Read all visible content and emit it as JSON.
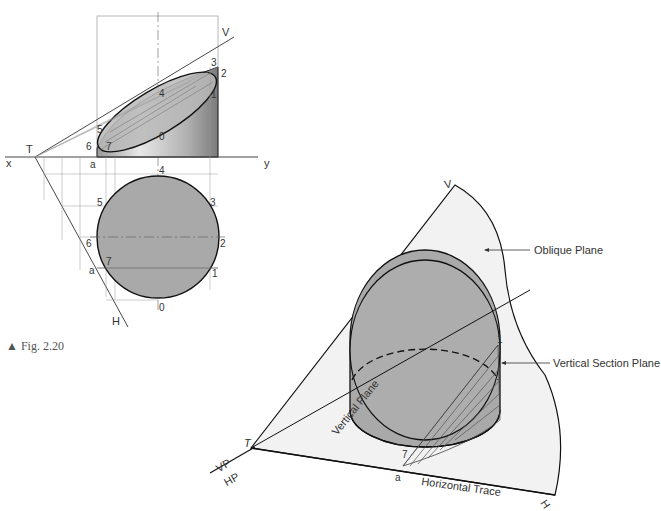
{
  "figure": {
    "caption": "▲ Fig. 2.20"
  },
  "orthographic": {
    "ground_line_left": "x",
    "ground_line_right": "y",
    "trace_point": "T",
    "vertical_trace": "V",
    "horizontal_trace": "H",
    "front_view_points": [
      "0",
      "1",
      "2",
      "3",
      "4",
      "5",
      "6",
      "7",
      "a"
    ],
    "top_view_points": [
      "0",
      "1",
      "2",
      "3",
      "4",
      "5",
      "6",
      "7",
      "a"
    ]
  },
  "pictorial": {
    "apex_label": "V",
    "trace_point": "T",
    "h_end_label": "H",
    "vp_label": "VP",
    "hp_label": "HP",
    "vertical_plane_label": "Vertical Plane",
    "horizontal_trace_label": "Horizontal Trace",
    "oblique_plane_label": "Oblique Plane",
    "vertical_section_plane_label": "Vertical Section Plane",
    "point_1": "1",
    "point_7": "7",
    "point_a": "a"
  },
  "colors": {
    "fill_gray": "#a9a9a9",
    "plane_fill": "#f2f2f2",
    "line": "#222222",
    "construction": "#8a8a8a"
  }
}
